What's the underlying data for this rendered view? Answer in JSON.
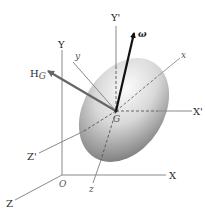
{
  "diagram": {
    "type": "rigid-body-angular-momentum",
    "labels": {
      "fixed_X": "X",
      "fixed_Y": "Y",
      "fixed_Z": "Z",
      "origin": "O",
      "centroidal_X": "X'",
      "centroidal_Y": "Y'",
      "centroidal_Z": "Z'",
      "body_x": "x",
      "body_y": "y",
      "body_z": "z",
      "center": "G",
      "angular_velocity": "ω",
      "angular_momentum": "H",
      "angular_momentum_sub": "G"
    },
    "colors": {
      "axes": "#777777",
      "arrow_omega": "#111111",
      "arrow_H": "#6a6a6a",
      "body_light": "#f4f4f4",
      "body_dark": "#7a7a7a"
    }
  }
}
